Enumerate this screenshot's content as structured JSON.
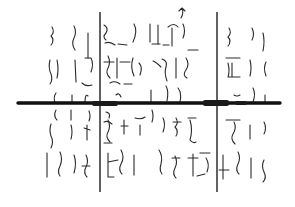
{
  "canvas": {
    "width": 295,
    "height": 207,
    "background": "#ffffff",
    "ink": "#2a2a2a"
  },
  "horizontal_bar": {
    "x1": 18,
    "y1": 103,
    "x2": 280,
    "y2": 103
  },
  "bar_knots": [
    {
      "x": 92,
      "y": 101,
      "w": 26,
      "h": 5
    },
    {
      "x": 203,
      "y": 100,
      "w": 26,
      "h": 6
    },
    {
      "x": 235,
      "y": 101,
      "w": 12,
      "h": 4
    }
  ],
  "vertical_lines": [
    {
      "x": 100,
      "y1": 12,
      "y2": 192
    },
    {
      "x": 217,
      "y1": 12,
      "y2": 192
    }
  ],
  "squiggles": [
    "M52,27 q3,5 -1,9 q4,4 0,9",
    "M74,26 q3,6 0,12 q-3,6 1,12",
    "M88,33 l0,25",
    "M50,60 q-2,8 1,14 q2,6 -1,10",
    "M57,60 q2,9 0,18",
    "M75,60 l1,22",
    "M85,58 l6,0 q3,6 0,14",
    "M82,83 q4,4 10,2",
    "M56,93 q-3,4 -1,10",
    "M72,95 l0,8",
    "M88,96 q-3,-3 -3,7",
    "M104,25 q5,3 2,8 q-4,4 0,7",
    "M105,43 q5,-2 10,2 M118,44 l9,1",
    "M108,56 q3,6 0,12 q-3,5 2,10",
    "M104,62 l10,0 M117,58 l0,20 M120,62 l10,0",
    "M110,83 q5,-3 10,1 M124,84 l8,0",
    "M116,95 q3,-3 5,2",
    "M134,24 q4,7 -1,18",
    "M133,58 q-3,9 1,18",
    "M139,63 q4,4 1,12",
    "M150,24 l0,18",
    "M158,25 l0,19",
    "M152,44 l8,0 M163,45 l6,0",
    "M172,28 l0,18 M168,27 q6,-5 10,0",
    "M183,24 q3,7 0,14",
    "M182,8 q2,5 -1,10 M179,11 l3,-3 l3,3",
    "M162,59 q6,2 4,8 q-2,6 1,14 M161,67 q-5,-5 -8,-6",
    "M176,58 l0,20",
    "M186,58 q4,6 0,12 q-4,5 1,8",
    "M188,50 l10,0",
    "M151,90 l0,13 M166,86 q3,5 1,15 M178,88 q4,5 2,14",
    "M229,28 q3,5 -1,9 q4,4 0,9",
    "M252,28 q3,6 0,12",
    "M263,33 q2,8 0,18",
    "M226,58 l14,0",
    "M228,63 q2,8 0,14 M232,63 l0,14 M228,77 l12,0",
    "M250,60 q2,8 0,16",
    "M266,62 q-3,6 0,14",
    "M234,95 q3,2 6,0",
    "M253,88 q3,6 0,14",
    "M265,95 l0,8",
    "M56,110 q-3,6 1,10",
    "M71,110 l0,10",
    "M89,111 q2,5 0,10",
    "M51,124 q-2,6 0,12 q3,6 0,12",
    "M71,125 q2,7 0,14",
    "M87,125 l0,15 M84,128 l6,2",
    "M47,153 l0,24",
    "M60,152 q3,7 0,14 q-3,6 0,10",
    "M74,155 q3,8 0,18",
    "M86,155 q3,6 0,12 q-3,6 1,10 M82,166 l8,0",
    "M106,112 q5,1 3,6 M104,122 q4,-2 8,2",
    "M108,120 q3,6 0,12 q-3,5 2,10",
    "M104,143 l8,0",
    "M124,120 l0,14 M121,126 l7,0",
    "M135,118 q6,2 10,-1",
    "M140,125 l0,10",
    "M108,153 l0,24 M108,162 l10,-2 M108,177 l6,0",
    "M121,150 q4,7 0,14 q-3,6 1,10",
    "M134,155 l0,20",
    "M152,110 q2,6 0,12",
    "M163,118 q3,6 0,14",
    "M176,118 q3,5 -1,9 q4,4 1,9 M173,122 l8,0",
    "M188,118 l8,0 M190,120 q3,10 0,20 q3,4 6,2",
    "M159,150 q4,6 2,14 q-2,6 1,10",
    "M175,156 q3,6 0,12 q-3,6 1,10 M172,158 l8,0",
    "M193,154 l0,22 M188,158 l10,0",
    "M206,158 q4,6 1,14 M205,174 l-8,2 M200,153 l10,0",
    "M226,120 l14,0 M234,122 q3,6 -1,12 q-3,5 2,10",
    "M250,125 l0,14",
    "M264,122 q3,6 0,12",
    "M223,155 l0,24 M219,170 l10,0",
    "M238,152 q3,6 0,12 q-3,6 1,10",
    "M251,158 l0,20",
    "M264,160 q-3,6 0,12 q3,6 -1,10"
  ]
}
